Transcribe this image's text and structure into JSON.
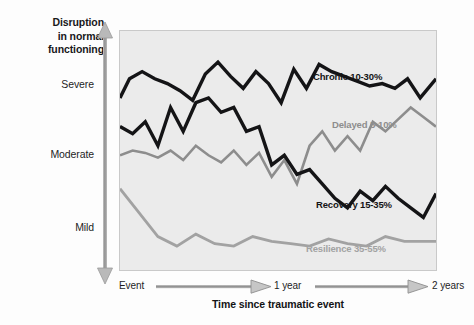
{
  "chart_data": {
    "type": "line",
    "title": "",
    "ylabel": "Disruption in normal functioning",
    "xlabel": "Time since traumatic event",
    "ylabel_lines": [
      "Disruption",
      "in normal",
      "functioning"
    ],
    "ytick_labels": [
      "Severe",
      "Moderate",
      "Mild"
    ],
    "xtick_labels": [
      "Event",
      "1 year",
      "2 years"
    ],
    "ylim": [
      0,
      100
    ],
    "xlim": [
      0,
      100
    ],
    "grid": false,
    "legend_position": "inline-annotations",
    "axis_style": "double-headed-arrow",
    "series": [
      {
        "name": "Chronic",
        "label": "Chronic 10-30%",
        "percent_range": "10-30%",
        "color": "#141416",
        "x": [
          0,
          3,
          7,
          11,
          15,
          19,
          23,
          27,
          31,
          35,
          39,
          43,
          47,
          51,
          55,
          59,
          63,
          67,
          71,
          75,
          79,
          83,
          87,
          91,
          95,
          100
        ],
        "y": [
          72,
          80,
          83,
          80,
          78,
          75,
          71,
          82,
          87,
          81,
          76,
          83,
          78,
          70,
          84,
          76,
          86,
          83,
          81,
          79,
          77,
          78,
          76,
          80,
          72,
          80
        ]
      },
      {
        "name": "Delayed",
        "label": "Delayed 5-10%",
        "percent_range": "5-10%",
        "color": "#8d8d8d",
        "x": [
          0,
          4,
          8,
          12,
          16,
          20,
          24,
          28,
          32,
          36,
          40,
          44,
          48,
          52,
          56,
          60,
          64,
          68,
          72,
          76,
          80,
          84,
          88,
          92,
          96,
          100
        ],
        "y": [
          48,
          50,
          49,
          47,
          50,
          46,
          52,
          48,
          45,
          50,
          44,
          49,
          39,
          46,
          36,
          52,
          58,
          50,
          56,
          50,
          62,
          58,
          63,
          68,
          64,
          60
        ]
      },
      {
        "name": "Recovery",
        "label": "Recovery 15-35%",
        "percent_range": "15-35%",
        "color": "#141416",
        "x": [
          0,
          4,
          8,
          12,
          16,
          20,
          24,
          28,
          32,
          36,
          40,
          44,
          48,
          52,
          56,
          60,
          64,
          68,
          72,
          76,
          80,
          84,
          88,
          92,
          96,
          100
        ],
        "y": [
          60,
          57,
          62,
          52,
          68,
          58,
          70,
          72,
          66,
          68,
          58,
          60,
          44,
          48,
          40,
          42,
          36,
          30,
          26,
          33,
          29,
          35,
          30,
          26,
          22,
          32
        ]
      },
      {
        "name": "Resilience",
        "label": "Resilience 35-55%",
        "percent_range": "35-55%",
        "color": "#a2a2a2",
        "x": [
          0,
          6,
          12,
          18,
          24,
          30,
          36,
          42,
          48,
          54,
          60,
          66,
          72,
          78,
          84,
          90,
          96,
          100
        ],
        "y": [
          34,
          24,
          14,
          10,
          15,
          11,
          10,
          14,
          12,
          11,
          10,
          13,
          11,
          10,
          14,
          12,
          12,
          12
        ]
      }
    ]
  },
  "axes": {
    "y_title_line1": "Disruption",
    "y_title_line2": "in normal",
    "y_title_line3": "functioning",
    "y_tick_severe": "Severe",
    "y_tick_moderate": "Moderate",
    "y_tick_mild": "Mild",
    "x_tick_event": "Event",
    "x_tick_1year": "1 year",
    "x_tick_2years": "2 years",
    "x_title": "Time since traumatic event"
  },
  "annotations": {
    "chronic": "Chronic 10-30%",
    "delayed": "Delayed 5-10%",
    "recovery": "Recovery 15-35%",
    "resilience": "Resilience 35-55%"
  },
  "colors": {
    "plot_background": "#ebebeb",
    "page_background": "#fdfdfd",
    "dark_series": "#141416",
    "mid_gray_series": "#8d8d8d",
    "light_gray_series": "#a2a2a2",
    "axis_arrow": "#9a9a9a",
    "plot_border": "#c9c9c9"
  }
}
